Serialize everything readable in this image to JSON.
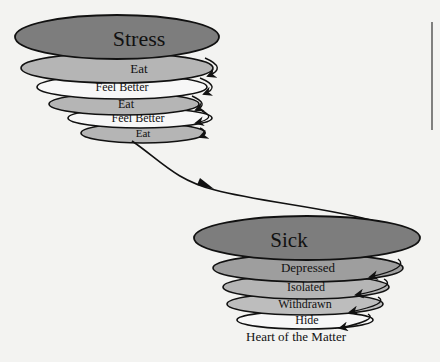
{
  "diagram": {
    "top_spiral": {
      "layers": [
        {
          "label": "Stress",
          "fill": "#7d7d7d"
        },
        {
          "label": "Eat",
          "fill": "#b5b5b5"
        },
        {
          "label": "Feel Better",
          "fill": "#f7f7f7"
        },
        {
          "label": "Eat",
          "fill": "#b5b5b5"
        },
        {
          "label": "Feel Better",
          "fill": "#f7f7f7"
        },
        {
          "label": "Eat",
          "fill": "#b5b5b5"
        }
      ]
    },
    "bottom_spiral": {
      "layers": [
        {
          "label": "Sick",
          "fill": "#7d7d7d"
        },
        {
          "label": "Depressed",
          "fill": "#9e9e9e"
        },
        {
          "label": "Isolated",
          "fill": "#b5b5b5"
        },
        {
          "label": "Withdrawn",
          "fill": "#bdbdbd"
        },
        {
          "label": "Hide",
          "fill": "#f7f7f7"
        }
      ]
    },
    "caption": "Heart of the Matter",
    "colors": {
      "stroke": "#111111",
      "background": "#f3f3f1"
    }
  }
}
